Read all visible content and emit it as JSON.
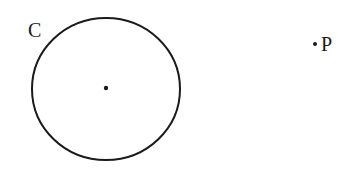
{
  "diagram": {
    "circle": {
      "label": "C",
      "has_center_point": true
    },
    "point": {
      "label": "P"
    },
    "colors": {
      "stroke": "#1a1a1a",
      "background": "#ffffff"
    }
  }
}
